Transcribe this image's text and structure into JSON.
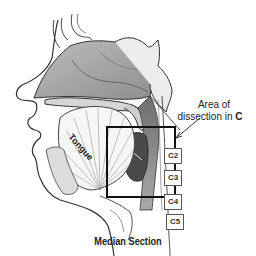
{
  "figure": {
    "caption": "Median Section",
    "callout": {
      "line1": "Area of",
      "line2_prefix": "dissection in ",
      "line2_bold": "C"
    },
    "structure_labels": {
      "tongue": "Tongue"
    },
    "vertebrae": [
      "C2",
      "C3",
      "C4",
      "C5"
    ]
  }
}
